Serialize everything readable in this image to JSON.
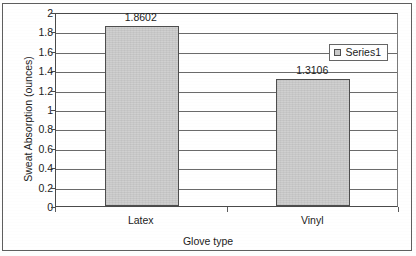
{
  "chart_data": {
    "type": "bar",
    "title": "",
    "categories": [
      "Latex",
      "Vinyl"
    ],
    "values": [
      1.8602,
      1.3106
    ],
    "data_labels": [
      "1.8602",
      "1.3106"
    ],
    "series": [
      {
        "name": "Series1",
        "values": [
          1.8602,
          1.3106
        ]
      }
    ],
    "xlabel": "Glove type",
    "ylabel": "Sweat Absorption (ounces)",
    "ylim": [
      0,
      2
    ],
    "ytick_step": 0.2,
    "yticks": [
      "0",
      "0.2",
      "0.4",
      "0.6",
      "0.8",
      "1",
      "1.2",
      "1.4",
      "1.6",
      "1.8",
      "2"
    ],
    "grid": true,
    "legend": {
      "position": "top-right-inside",
      "entries": [
        "Series1"
      ]
    },
    "colors": {
      "bar_fill": "#cdcdcd",
      "bar_edge": "#4e4e4e",
      "grid": "#6b6b6b",
      "axis": "#4a4a4a",
      "text": "#1c1c1c"
    }
  }
}
